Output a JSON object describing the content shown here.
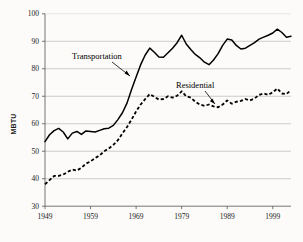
{
  "chart_data": {
    "type": "line",
    "title": "",
    "subtitle": "",
    "xlabel": "",
    "ylabel": "MBTU",
    "xlim": [
      1949,
      2003
    ],
    "ylim": [
      30,
      100
    ],
    "ytick_labels": [
      "100",
      "90",
      "80",
      "70",
      "60",
      "50",
      "40",
      "30"
    ],
    "ytick_values": [
      100,
      90,
      80,
      70,
      60,
      50,
      40,
      30
    ],
    "xtick_labels": [
      "1949",
      "1959",
      "1969",
      "1979",
      "1989",
      "1999"
    ],
    "xtick_values": [
      1949,
      1959,
      1969,
      1979,
      1989,
      1999
    ],
    "grid": "horizontal",
    "legend_position": "inline-annotations",
    "annotations": [
      {
        "text": "Transportation",
        "points_to_series": "Transportation",
        "x": 1966,
        "y": 79
      },
      {
        "text": "Residential",
        "points_to_series": "Residential",
        "x": 1987,
        "y": 67
      }
    ],
    "x": [
      1949,
      1950,
      1951,
      1952,
      1953,
      1954,
      1955,
      1956,
      1957,
      1958,
      1959,
      1960,
      1961,
      1962,
      1963,
      1964,
      1965,
      1966,
      1967,
      1968,
      1969,
      1970,
      1971,
      1972,
      1973,
      1974,
      1975,
      1976,
      1977,
      1978,
      1979,
      1980,
      1981,
      1982,
      1983,
      1984,
      1985,
      1986,
      1987,
      1988,
      1989,
      1990,
      1991,
      1992,
      1993,
      1994,
      1995,
      1996,
      1997,
      1998,
      1999,
      2000,
      2001,
      2002,
      2003
    ],
    "series": [
      {
        "name": "Transportation",
        "style": "solid",
        "color": "#000000",
        "values": [
          53.5,
          56.0,
          57.5,
          58.3,
          57.0,
          54.5,
          56.6,
          57.2,
          56.1,
          57.4,
          57.2,
          57.0,
          57.6,
          58.2,
          58.4,
          59.4,
          61.5,
          64.0,
          67.5,
          72.5,
          77.0,
          81.5,
          85.0,
          87.5,
          86.0,
          84.3,
          84.2,
          85.8,
          87.5,
          89.5,
          92.2,
          89.0,
          87.0,
          85.2,
          84.0,
          82.4,
          81.5,
          83.2,
          85.5,
          88.5,
          90.8,
          90.5,
          88.5,
          87.2,
          87.5,
          88.5,
          89.5,
          90.8,
          91.5,
          92.2,
          93.0,
          94.4,
          93.2,
          91.5,
          91.8
        ]
      },
      {
        "name": "Residential",
        "style": "dashed",
        "color": "#000000",
        "values": [
          38.0,
          39.5,
          41.0,
          41.0,
          41.5,
          42.5,
          43.3,
          43.0,
          44.0,
          45.5,
          46.3,
          47.5,
          48.5,
          50.0,
          51.0,
          52.3,
          54.0,
          56.5,
          58.8,
          61.5,
          64.5,
          67.0,
          69.0,
          70.8,
          69.8,
          68.8,
          69.0,
          70.0,
          69.5,
          70.2,
          71.8,
          70.0,
          69.5,
          68.0,
          67.0,
          66.5,
          67.0,
          66.3,
          66.0,
          67.0,
          68.5,
          67.3,
          68.0,
          68.3,
          69.0,
          68.5,
          69.2,
          70.5,
          71.0,
          70.5,
          71.5,
          72.8,
          71.0,
          70.8,
          72.2
        ]
      }
    ]
  }
}
